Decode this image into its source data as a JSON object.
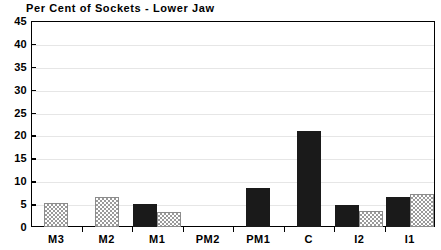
{
  "chart_data": {
    "type": "bar",
    "title": "Per Cent of Sockets - Lower Jaw",
    "xlabel": "",
    "ylabel": "",
    "ylim": [
      0,
      45
    ],
    "ytick_step": 5,
    "yticks": [
      "0",
      "5",
      "10",
      "15",
      "20",
      "25",
      "30",
      "35",
      "40",
      "45"
    ],
    "grid": true,
    "legend": "none",
    "categories": [
      "M3",
      "M2",
      "M1",
      "PM2",
      "PM1",
      "C",
      "I2",
      "I1"
    ],
    "series": [
      {
        "name": "solid",
        "style": "solid-black",
        "color": "#1a1a1a",
        "values": [
          0,
          0,
          5.1,
          0,
          8.6,
          21.0,
          4.9,
          6.5
        ]
      },
      {
        "name": "hatched",
        "style": "checkered-grey",
        "color": "#9a9a9a",
        "values": [
          5.3,
          6.5,
          3.2,
          0,
          0,
          0,
          3.6,
          7.3
        ]
      }
    ]
  },
  "axis_colors": {
    "axis_line": "#000000",
    "gridline": "#e6e6e6",
    "background": "#ffffff"
  }
}
